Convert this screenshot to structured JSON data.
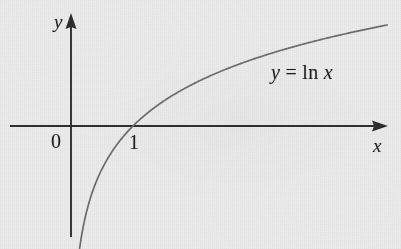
{
  "figure": {
    "kind": "math-graph",
    "background_color": "#ececec",
    "ink_color": "#1e1e1e",
    "curve_color": "#6a6a6a",
    "width": 401,
    "height": 249
  },
  "labels": {
    "y_axis": "y",
    "x_axis": "x",
    "origin": "0",
    "unit_x": "1",
    "equation": "y = ln x"
  },
  "chart_data": {
    "type": "line",
    "title": "",
    "subtitle": "",
    "xlabel": "x",
    "ylabel": "y",
    "annotations": [
      "y = ln x"
    ],
    "tick_labels": {
      "x": [
        "0",
        "1"
      ],
      "y": []
    },
    "grid": false,
    "legend": null,
    "axes": {
      "x_axis_pixel_y": 126,
      "y_axis_pixel_x": 71,
      "unit_pixels_per_x": 62,
      "unit_pixels_per_y": 62,
      "x_arrow": true,
      "y_arrow": true,
      "x_axis_pixel_range": [
        10,
        388
      ],
      "y_axis_pixel_range": [
        14,
        237
      ]
    },
    "function": "y = ln(x)",
    "domain": [
      0.12,
      5.1
    ],
    "xlim": [
      -1.0,
      5.1
    ],
    "ylim": [
      -2.0,
      1.7
    ],
    "series": [
      {
        "name": "y = ln x",
        "x": [
          0.12,
          0.18,
          0.25,
          0.35,
          0.5,
          0.7,
          1.0,
          1.3,
          1.7,
          2.2,
          2.8,
          3.4,
          4.1,
          4.6,
          5.1
        ],
        "y": [
          -2.12,
          -1.71,
          -1.39,
          -1.05,
          -0.69,
          -0.36,
          0.0,
          0.26,
          0.53,
          0.79,
          1.03,
          1.22,
          1.41,
          1.53,
          1.63
        ]
      }
    ],
    "key_points": [
      {
        "x": 1,
        "y": 0,
        "label": "1"
      }
    ]
  }
}
